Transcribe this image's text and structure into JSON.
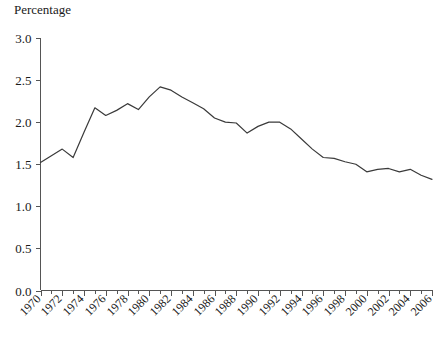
{
  "chart_data": {
    "type": "line",
    "title": "Percentage",
    "xlabel": "",
    "ylabel": "Percentage",
    "ylim": [
      0.0,
      3.0
    ],
    "xlim": [
      1970,
      2006
    ],
    "grid": false,
    "legend": "none",
    "y_ticks": [
      "0.0",
      "0.5",
      "1.0",
      "1.5",
      "2.0",
      "2.5",
      "3.0"
    ],
    "y_tick_values": [
      0.0,
      0.5,
      1.0,
      1.5,
      2.0,
      2.5,
      3.0
    ],
    "x_tick_labels": [
      "1970",
      "1972",
      "1974",
      "1976",
      "1978",
      "1980",
      "1982",
      "1984",
      "1986",
      "1988",
      "1990",
      "1992",
      "1994",
      "1996",
      "1998",
      "2000",
      "2002",
      "2004",
      "2006"
    ],
    "x_tick_values": [
      1970,
      1972,
      1974,
      1976,
      1978,
      1980,
      1982,
      1984,
      1986,
      1988,
      1990,
      1992,
      1994,
      1996,
      1998,
      2000,
      2002,
      2004,
      2006
    ],
    "x_minor_ticks": [
      1971,
      1973,
      1975,
      1977,
      1979,
      1981,
      1983,
      1985,
      1987,
      1989,
      1991,
      1993,
      1995,
      1997,
      1999,
      2001,
      2003,
      2005
    ],
    "x": [
      1970,
      1971,
      1972,
      1973,
      1974,
      1975,
      1976,
      1977,
      1978,
      1979,
      1980,
      1981,
      1982,
      1983,
      1984,
      1985,
      1986,
      1987,
      1988,
      1989,
      1990,
      1991,
      1992,
      1993,
      1994,
      1995,
      1996,
      1997,
      1998,
      1999,
      2000,
      2001,
      2002,
      2003,
      2004,
      2005,
      2006
    ],
    "values": [
      1.52,
      1.6,
      1.68,
      1.58,
      1.88,
      2.17,
      2.08,
      2.14,
      2.22,
      2.15,
      2.3,
      2.42,
      2.38,
      2.3,
      2.23,
      2.16,
      2.05,
      2.0,
      1.99,
      1.87,
      1.95,
      2.0,
      2.0,
      1.92,
      1.8,
      1.68,
      1.58,
      1.57,
      1.53,
      1.5,
      1.41,
      1.44,
      1.45,
      1.41,
      1.44,
      1.37,
      1.32
    ],
    "line_color": "#3a3a3a",
    "axis_color": "#555555",
    "text_color": "#1a1a1a",
    "background": "#ffffff"
  },
  "axis_title_label": "Percentage"
}
